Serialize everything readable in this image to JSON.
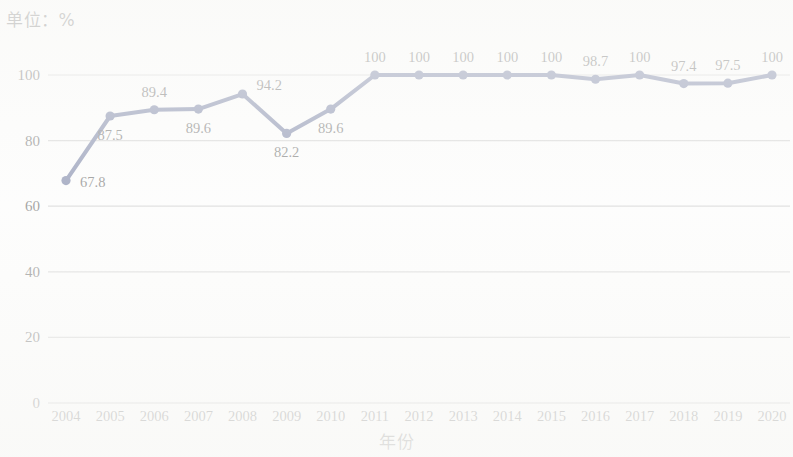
{
  "unit_label": "单位：%",
  "x_axis_title": "年份",
  "colors": {
    "series": "#2b3a72",
    "grid": "#b9b9b9",
    "text": "#1a1a1a",
    "background": "#fdfdfd"
  },
  "chart_data": {
    "type": "line",
    "title": "单位：%",
    "xlabel": "年份",
    "ylabel": "",
    "ylim": [
      0,
      100
    ],
    "yticks": [
      0,
      20,
      40,
      60,
      80,
      100
    ],
    "grid": true,
    "legend": "none",
    "marker": "circle",
    "categories": [
      "2004",
      "2005",
      "2006",
      "2007",
      "2008",
      "2009",
      "2010",
      "2011",
      "2012",
      "2013",
      "2014",
      "2015",
      "2016",
      "2017",
      "2018",
      "2019",
      "2020"
    ],
    "values": [
      67.8,
      87.5,
      89.4,
      89.6,
      94.2,
      82.2,
      89.6,
      100,
      100,
      100,
      100,
      100,
      98.7,
      100,
      97.4,
      97.5,
      100
    ],
    "data_labels": [
      "67.8",
      "87.5",
      "89.4",
      "89.6",
      "94.2",
      "82.2",
      "89.6",
      "100",
      "100",
      "100",
      "100",
      "100",
      "98.7",
      "100",
      "97.4",
      "97.5",
      "100"
    ],
    "label_placement": [
      "right-below",
      "below",
      "above",
      "below",
      "right-above",
      "below",
      "below",
      "above",
      "above",
      "above",
      "above",
      "above",
      "above",
      "above",
      "above",
      "above",
      "above"
    ]
  }
}
